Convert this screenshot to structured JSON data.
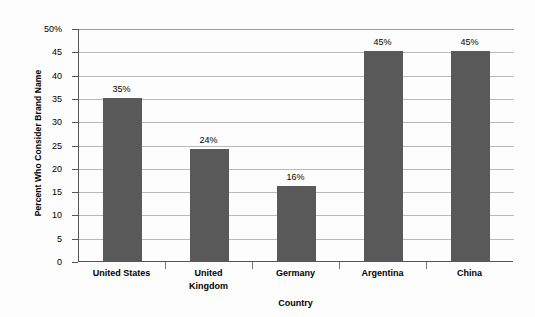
{
  "chart_data": {
    "type": "bar",
    "title": "",
    "xlabel": "Country",
    "ylabel": "Percent Who Consider Brand Name",
    "categories": [
      "United States",
      "United\nKingdom",
      "Germany",
      "Argentina",
      "China"
    ],
    "values": [
      35,
      24,
      16,
      45,
      45
    ],
    "data_labels": [
      "35%",
      "24%",
      "16%",
      "45%",
      "45%"
    ],
    "ylim": [
      0,
      50
    ],
    "ytick_values": [
      50,
      45,
      40,
      35,
      30,
      25,
      20,
      15,
      10,
      5,
      0
    ],
    "ytick_labels": [
      "50%",
      "45",
      "40",
      "35",
      "30",
      "25",
      "20",
      "15",
      "10",
      "5",
      "0"
    ],
    "grid": "horizontal",
    "legend": "none",
    "bar_color": "#595959",
    "gridline_color": "#b9b9b9",
    "axis_color": "#555555",
    "background_color": "#fdfdfd"
  }
}
